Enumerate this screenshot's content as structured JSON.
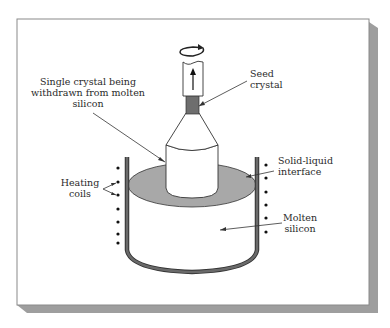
{
  "figure": {
    "labels": {
      "single_crystal": [
        "Single crystal being",
        "withdrawn from molten",
        "silicon"
      ],
      "seed_crystal": [
        "Seed",
        "crystal"
      ],
      "solid_liquid_interface": [
        "Solid-liquid",
        "interface"
      ],
      "heating_coils": [
        "Heating",
        "coils"
      ],
      "molten_silicon": [
        "Molten",
        "silicon"
      ]
    },
    "icons": {
      "rotation": "rotation-arrow-icon",
      "pull_direction": "up-arrow-icon"
    },
    "colors": {
      "panel": "#ffffff",
      "shadow": "#9e9e9e",
      "outline": "#333333",
      "seed": "#6e6e6e",
      "interface": "#a8a8a8",
      "crucible_wall": "#6a6a6a",
      "coil_dot": "#111111"
    }
  }
}
